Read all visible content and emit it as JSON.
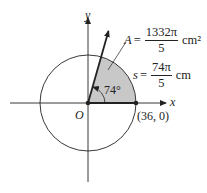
{
  "diagram": {
    "type": "circle-sector",
    "axes": {
      "x_label": "x",
      "y_label": "y",
      "origin_label": "O"
    },
    "circle": {
      "center": "O",
      "radius": 36
    },
    "point": {
      "label": "(36, 0)",
      "x": 36,
      "y": 0
    },
    "angle": {
      "label": "74°",
      "degrees": 74
    },
    "area": {
      "var": "A",
      "eq": "=",
      "numerator": "1332π",
      "denominator": "5",
      "unit": "cm²"
    },
    "arc": {
      "var": "s",
      "eq": "=",
      "numerator": "74π",
      "denominator": "5",
      "unit": "cm"
    },
    "colors": {
      "sector_fill": "#c8c8c8",
      "line": "#222222",
      "background": "#ffffff"
    }
  }
}
